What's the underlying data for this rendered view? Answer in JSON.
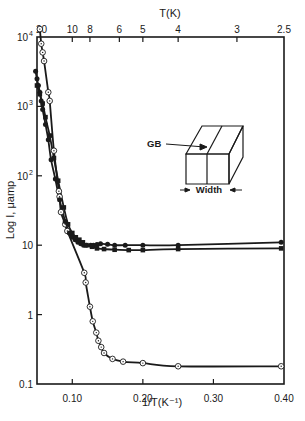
{
  "chart_data": {
    "type": "scatter",
    "title": "",
    "xlabel": "1/T(K⁻¹)",
    "ylabel": "Log I, μamp",
    "top_xlabel": "T(K)",
    "yscale": "log",
    "xlim": [
      0.05,
      0.4
    ],
    "ylim": [
      0.1,
      10000
    ],
    "x_ticks": [
      {
        "value": 0.1,
        "label": "0.10"
      },
      {
        "value": 0.2,
        "label": "0.20"
      },
      {
        "value": 0.3,
        "label": "0.30"
      },
      {
        "value": 0.4,
        "label": "0.40"
      }
    ],
    "y_ticks": [
      {
        "value": 10000,
        "label": "10",
        "sup": "4"
      },
      {
        "value": 1000,
        "label": "10",
        "sup": "3"
      },
      {
        "value": 100,
        "label": "10",
        "sup": "2"
      },
      {
        "value": 10,
        "label": "10",
        "sup": ""
      },
      {
        "value": 1,
        "label": "1",
        "sup": ""
      },
      {
        "value": 0.1,
        "label": "0.1",
        "sup": ""
      }
    ],
    "top_ticks": [
      {
        "value": 0.05,
        "label": "20"
      },
      {
        "value": 0.1,
        "label": "10"
      },
      {
        "value": 0.125,
        "label": "8"
      },
      {
        "value": 0.1667,
        "label": "6"
      },
      {
        "value": 0.2,
        "label": "5"
      },
      {
        "value": 0.25,
        "label": "4"
      },
      {
        "value": 0.3333,
        "label": "3"
      },
      {
        "value": 0.4,
        "label": "2.5"
      }
    ],
    "grid": false,
    "legend": null,
    "series": [
      {
        "name": "open-circles",
        "marker": "open-circle-dot",
        "x": [
          0.054,
          0.056,
          0.058,
          0.06,
          0.066,
          0.068,
          0.074,
          0.081,
          0.082,
          0.084,
          0.09,
          0.093,
          0.117,
          0.119,
          0.125,
          0.129,
          0.134,
          0.137,
          0.141,
          0.145,
          0.157,
          0.172,
          0.2,
          0.25,
          0.396
        ],
        "y": [
          13000,
          8000,
          6000,
          4500,
          1600,
          1200,
          230,
          60,
          50,
          30,
          20,
          16,
          4.0,
          2.9,
          1.3,
          0.8,
          0.55,
          0.42,
          0.34,
          0.28,
          0.23,
          0.21,
          0.2,
          0.18,
          0.18
        ]
      },
      {
        "name": "filled-circles-upper",
        "marker": "filled-circle",
        "x": [
          0.048,
          0.05,
          0.052,
          0.054,
          0.056,
          0.058,
          0.062,
          0.066,
          0.07,
          0.076,
          0.082,
          0.09,
          0.096,
          0.1,
          0.104,
          0.108,
          0.112,
          0.116,
          0.12,
          0.126,
          0.13,
          0.135,
          0.14,
          0.15,
          0.16,
          0.175,
          0.2,
          0.25,
          0.396
        ],
        "y": [
          3200,
          2500,
          2000,
          1600,
          1200,
          900,
          550,
          330,
          170,
          90,
          45,
          22,
          15,
          13,
          12,
          11,
          10.5,
          10,
          10,
          10,
          10,
          10.2,
          10.5,
          10.3,
          10,
          10,
          10,
          10,
          11
        ]
      },
      {
        "name": "filled-squares-lower",
        "marker": "filled-square",
        "x": [
          0.05,
          0.054,
          0.058,
          0.062,
          0.068,
          0.074,
          0.08,
          0.088,
          0.094,
          0.1,
          0.105,
          0.11,
          0.115,
          0.12,
          0.128,
          0.135,
          0.145,
          0.16,
          0.18,
          0.2,
          0.25,
          0.396
        ],
        "y": [
          2000,
          1500,
          1100,
          700,
          380,
          180,
          85,
          35,
          20,
          15,
          13,
          12,
          11,
          10,
          9.5,
          9,
          8.8,
          8.6,
          8.5,
          8.5,
          8.8,
          9
        ]
      }
    ],
    "annotations": [
      {
        "text": "GB",
        "type": "inset-label"
      },
      {
        "text": "Width",
        "type": "inset-label"
      }
    ]
  },
  "inset": {
    "gb_label": "GB",
    "width_label": "Width"
  }
}
